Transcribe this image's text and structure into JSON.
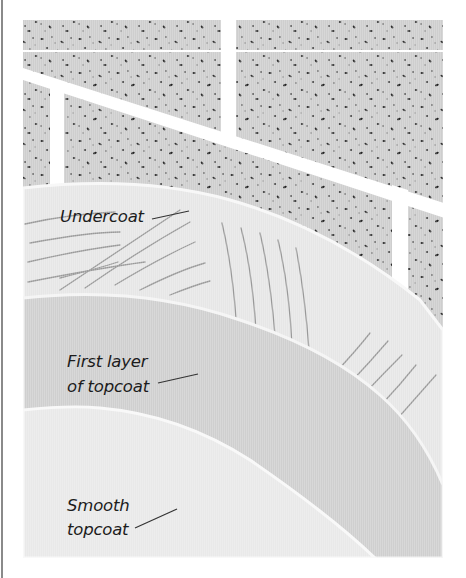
{
  "figure": {
    "type": "plastering layers illustration",
    "background_wall": "brick-block-wall-with-mortar-joints",
    "colors": {
      "page_bg": "#ffffff",
      "block": "#c9c9c9",
      "speckle": "#2a2a2a",
      "mortar": "#ffffff",
      "undercoat": "#e6e6e6",
      "undercoat_scratch": "#8c8c8c",
      "first_topcoat": "#cfcfcf",
      "smooth_topcoat": "#e9e9e9",
      "layer_edge": "#f7f7f7",
      "leader_line": "#333333",
      "left_rule": "#8a8a8a"
    }
  },
  "labels": {
    "undercoat": {
      "line1": "Undercoat"
    },
    "first_layer": {
      "line1": "First layer",
      "line2": "of topcoat"
    },
    "smooth_topcoat": {
      "line1": "Smooth",
      "line2": "topcoat"
    }
  }
}
